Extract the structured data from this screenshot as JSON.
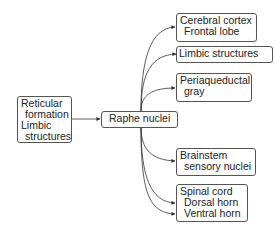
{
  "diagram": {
    "type": "flow",
    "source": {
      "lines": [
        "Reticular",
        "formation",
        "Limbic",
        "structures"
      ]
    },
    "hub": {
      "label": "Raphe nuclei"
    },
    "targets": [
      {
        "lines": [
          "Cerebral cortex",
          "Frontal lobe"
        ]
      },
      {
        "lines": [
          "Limbic structures"
        ]
      },
      {
        "lines": [
          "Periaqueductal",
          "gray"
        ]
      },
      {
        "lines": [
          "Brainstem",
          "sensory nuclei"
        ]
      },
      {
        "lines": [
          "Spinal cord",
          "Dorsal horn",
          "Ventral horn"
        ]
      }
    ],
    "colors": {
      "line": "#333333",
      "border": "#555555",
      "text": "#222222"
    }
  }
}
